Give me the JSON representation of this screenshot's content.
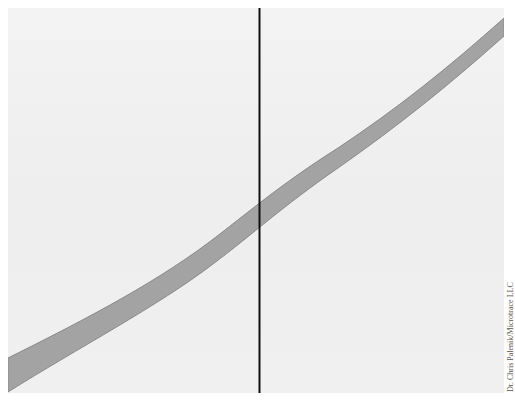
{
  "image": {
    "description": "Transmitted-light micrograph of a single fiber crossing diagonally from lower-left to upper-right, with a vertical black reference line",
    "background_color": "#f1f1f1",
    "fiber_color": "#a3a3a3",
    "fiber_edge_color": "#8a8a8a",
    "line_color": "#111111"
  },
  "credit": "Dr. Chris Palenik/Microtrace LLC"
}
